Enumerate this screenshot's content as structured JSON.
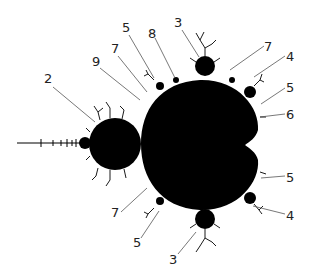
{
  "figure": {
    "colors": {
      "set": "#000000",
      "background": "#ffffff",
      "leader": "#555555",
      "label": "#222222"
    }
  },
  "labels": [
    {
      "id": "period-2-bulb",
      "text": "2",
      "x": 44,
      "y": 72,
      "tx": 95,
      "ty": 122
    },
    {
      "id": "period-9-bulb",
      "text": "9",
      "x": 92,
      "y": 55,
      "tx": 140,
      "ty": 100
    },
    {
      "id": "period-7-bulb-upper-left",
      "text": "7",
      "x": 111,
      "y": 42,
      "tx": 147,
      "ty": 92
    },
    {
      "id": "period-5-bulb-upper-left",
      "text": "5",
      "x": 122,
      "y": 21,
      "tx": 154,
      "ty": 78
    },
    {
      "id": "period-8-bulb",
      "text": "8",
      "x": 148,
      "y": 27,
      "tx": 175,
      "ty": 78
    },
    {
      "id": "period-3-bulb-top",
      "text": "3",
      "x": 174,
      "y": 16,
      "tx": 199,
      "ty": 57
    },
    {
      "id": "period-7-bulb-upper-right",
      "text": "7",
      "x": 264,
      "y": 40,
      "tx": 230,
      "ty": 70
    },
    {
      "id": "period-4-bulb-upper",
      "text": "4",
      "x": 286,
      "y": 50,
      "tx": 254,
      "ty": 77
    },
    {
      "id": "period-5-bulb-right-upper",
      "text": "5",
      "x": 286,
      "y": 81,
      "tx": 261,
      "ty": 104
    },
    {
      "id": "period-6-bulb",
      "text": "6",
      "x": 286,
      "y": 108,
      "tx": 260,
      "ty": 117
    },
    {
      "id": "period-5-bulb-right-lower",
      "text": "5",
      "x": 286,
      "y": 171,
      "tx": 261,
      "ty": 178
    },
    {
      "id": "period-4-bulb-lower",
      "text": "4",
      "x": 286,
      "y": 209,
      "tx": 253,
      "ty": 206
    },
    {
      "id": "period-7-bulb-lower-left",
      "text": "7",
      "x": 111,
      "y": 206,
      "tx": 147,
      "ty": 188
    },
    {
      "id": "period-5-bulb-lower-left",
      "text": "5",
      "x": 133,
      "y": 236,
      "tx": 159,
      "ty": 211
    },
    {
      "id": "period-3-bulb-bottom",
      "text": "3",
      "x": 169,
      "y": 253,
      "tx": 196,
      "ty": 232
    }
  ]
}
